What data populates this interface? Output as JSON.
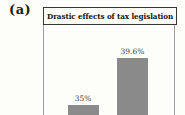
{
  "figure": {
    "panel_label": "(a)"
  },
  "chart_data": {
    "type": "bar",
    "title": "Drastic effects of tax legislation",
    "categories": [
      "",
      ""
    ],
    "values": [
      35,
      39.6
    ],
    "value_labels": [
      "35%",
      "39.6%"
    ],
    "xlabel": "",
    "ylabel": "",
    "ylim": [
      34,
      42.8
    ],
    "grid": false,
    "legend": false,
    "axis_truncated": true
  },
  "colors": {
    "bar": "#8a8a8a",
    "title_border": "#353535",
    "plot_border": "#9d9d9d",
    "label_text": "#3a3a3a",
    "background": "#fdfdfa"
  }
}
